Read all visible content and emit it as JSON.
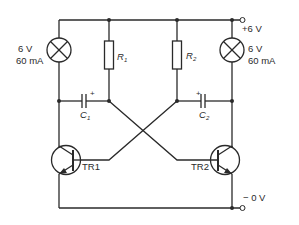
{
  "diagram": {
    "supply": {
      "positive": "+6 V",
      "negative": "− 0 V"
    },
    "lamps": [
      {
        "id": "L1",
        "voltage": "6 V",
        "current": "60 mA"
      },
      {
        "id": "L2",
        "voltage": "6 V",
        "current": "60 mA"
      }
    ],
    "resistors": [
      {
        "id": "R1",
        "symbol": "R",
        "sub": "1"
      },
      {
        "id": "R2",
        "symbol": "R",
        "sub": "2"
      }
    ],
    "capacitors": [
      {
        "id": "C1",
        "symbol": "C",
        "sub": "1",
        "polarity": "+"
      },
      {
        "id": "C2",
        "symbol": "C",
        "sub": "2",
        "polarity": "+"
      }
    ],
    "transistors": [
      {
        "id": "TR1",
        "label": "TR1",
        "type": "NPN"
      },
      {
        "id": "TR2",
        "label": "TR2",
        "type": "NPN"
      }
    ],
    "colors": {
      "ink": "#2a2a2a",
      "background": "#ffffff"
    }
  }
}
